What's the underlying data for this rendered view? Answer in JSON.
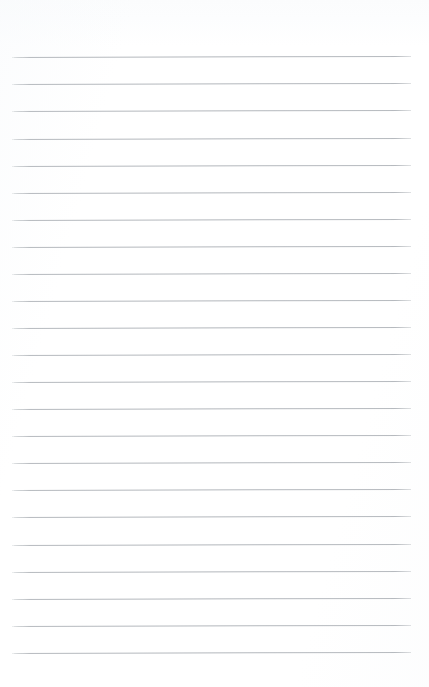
{
  "page": {
    "kind": "ruled-notepad-page",
    "width": 429,
    "height": 687,
    "background_color": "#ffffff",
    "has_text": false,
    "visible_text": ""
  },
  "ruling": {
    "line_color": "#b2b6bb",
    "line_thickness_px": 1,
    "line_count": 23,
    "first_line_y": 57,
    "last_line_y": 653,
    "line_spacing_px": 27.1,
    "line_start_x": 14,
    "line_end_x": 411,
    "line_length_px": 397,
    "left_margin_px": 14,
    "right_margin_px": 18,
    "top_margin_px": 57,
    "bottom_margin_px": 34,
    "slant_deg": -0.16,
    "lines": [
      {
        "index": 1,
        "y": 57
      },
      {
        "index": 2,
        "y": 84
      },
      {
        "index": 3,
        "y": 111
      },
      {
        "index": 4,
        "y": 139
      },
      {
        "index": 5,
        "y": 166
      },
      {
        "index": 6,
        "y": 193
      },
      {
        "index": 7,
        "y": 220
      },
      {
        "index": 8,
        "y": 247
      },
      {
        "index": 9,
        "y": 274
      },
      {
        "index": 10,
        "y": 301
      },
      {
        "index": 11,
        "y": 328
      },
      {
        "index": 12,
        "y": 355
      },
      {
        "index": 13,
        "y": 382
      },
      {
        "index": 14,
        "y": 409
      },
      {
        "index": 15,
        "y": 436
      },
      {
        "index": 16,
        "y": 463
      },
      {
        "index": 17,
        "y": 490
      },
      {
        "index": 18,
        "y": 517
      },
      {
        "index": 19,
        "y": 545
      },
      {
        "index": 20,
        "y": 572
      },
      {
        "index": 21,
        "y": 599
      },
      {
        "index": 22,
        "y": 626
      },
      {
        "index": 23,
        "y": 653
      }
    ]
  }
}
